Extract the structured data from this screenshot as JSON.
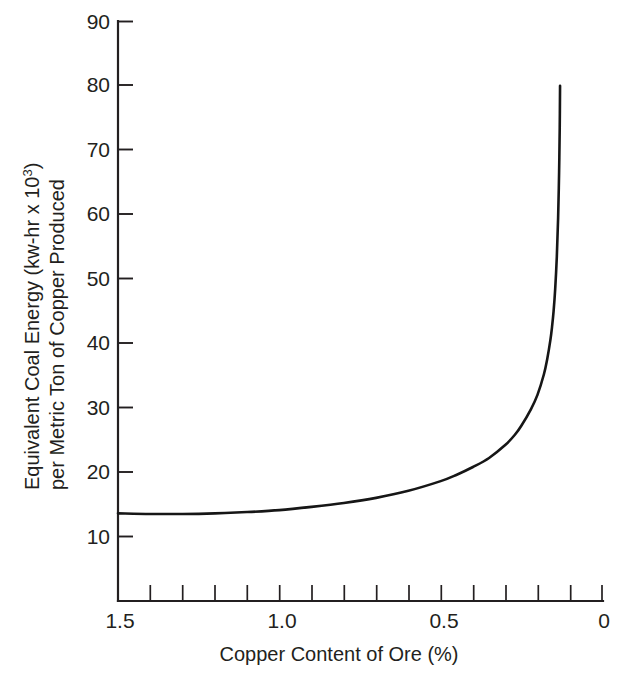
{
  "chart_data": {
    "type": "line",
    "title": "",
    "subtitle": "",
    "xlabel": "Copper Content of Ore (%)",
    "ylabel_line1": "Equivalent Coal Energy (kw-hr x 10",
    "ylabel_line1_sup": "3",
    "ylabel_line1_tail": ")",
    "ylabel_line2": "per Metric Ton of Copper Produced",
    "ylabel_full": "Equivalent Coal Energy (kw-hr x 10^3) per Metric Ton of Copper Produced",
    "xlim": [
      1.5,
      0.0
    ],
    "ylim": [
      0,
      90
    ],
    "x_axis_reversed": true,
    "grid": false,
    "legend": "none",
    "x_major_ticks": [
      1.5,
      1.0,
      0.5,
      0.0
    ],
    "x_major_tick_labels": [
      "1.5",
      "1.0",
      "0.5",
      "0"
    ],
    "x_minor_ticks": [
      1.4,
      1.3,
      1.2,
      1.1,
      0.9,
      0.8,
      0.7,
      0.6,
      0.4,
      0.3,
      0.2,
      0.1
    ],
    "y_major_ticks": [
      10,
      20,
      30,
      40,
      50,
      60,
      70,
      80,
      90
    ],
    "y_major_tick_labels": [
      "10",
      "20",
      "30",
      "40",
      "50",
      "60",
      "70",
      "80",
      "90"
    ],
    "series": [
      {
        "name": "Equivalent coal energy vs copper ore grade",
        "x": [
          1.5,
          1.4,
          1.3,
          1.2,
          1.1,
          1.0,
          0.9,
          0.8,
          0.7,
          0.6,
          0.5,
          0.45,
          0.4,
          0.35,
          0.3,
          0.27,
          0.25,
          0.22,
          0.2,
          0.18,
          0.17,
          0.16,
          0.155,
          0.15,
          0.145,
          0.14,
          0.136,
          0.133,
          0.131,
          0.13
        ],
        "y": [
          13.6,
          13.5,
          13.5,
          13.6,
          13.8,
          14.1,
          14.6,
          15.2,
          16.0,
          17.1,
          18.6,
          19.6,
          20.8,
          22.2,
          24.2,
          25.8,
          27.2,
          29.8,
          32.0,
          35.2,
          37.5,
          40.5,
          42.5,
          45.0,
          48.5,
          53.5,
          59.5,
          66.5,
          73.5,
          80.0
        ]
      }
    ],
    "curve_endpoint_top": {
      "x": 0.13,
      "y": 80.0
    },
    "curve_endpoint_left": {
      "x": 1.5,
      "y": 13.6
    },
    "axis_color": "#231f20",
    "curve_color": "#161616",
    "background_color": "#ffffff"
  }
}
